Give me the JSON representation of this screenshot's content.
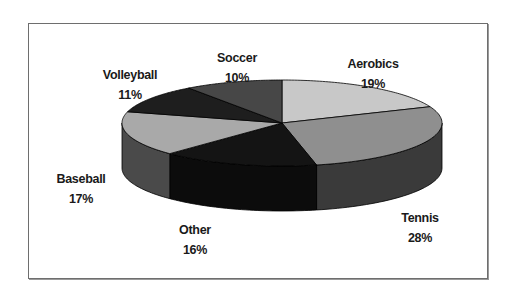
{
  "chart_data": {
    "type": "pie",
    "style": "3d",
    "title": "",
    "categories": [
      "Aerobics",
      "Tennis",
      "Other",
      "Baseball",
      "Volleyball",
      "Soccer"
    ],
    "values": [
      19,
      28,
      16,
      17,
      11,
      10
    ],
    "unit": "%",
    "start_angle_deg": 0,
    "direction": "clockwise",
    "legend": "none",
    "labels": [
      {
        "name": "Aerobics",
        "pct": "19%"
      },
      {
        "name": "Tennis",
        "pct": "28%"
      },
      {
        "name": "Other",
        "pct": "16%"
      },
      {
        "name": "Baseball",
        "pct": "17%"
      },
      {
        "name": "Volleyball",
        "pct": "11%"
      },
      {
        "name": "Soccer",
        "pct": "10%"
      }
    ],
    "colors": {
      "Aerobics": {
        "top": "#c8c8c8",
        "side": "#8a8a8a"
      },
      "Tennis": {
        "top": "#8f8f8f",
        "side": "#3a3a3a"
      },
      "Other": {
        "top": "#141414",
        "side": "#0c0c0c"
      },
      "Baseball": {
        "top": "#a9a9a9",
        "side": "#4a4a4a"
      },
      "Volleyball": {
        "top": "#1e1e1e",
        "side": "#141414"
      },
      "Soccer": {
        "top": "#474747",
        "side": "#2a2a2a"
      }
    }
  }
}
